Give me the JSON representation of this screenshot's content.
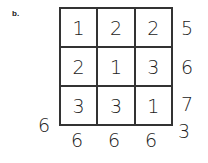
{
  "label": "b.",
  "grid": [
    [
      "1",
      "2",
      "2"
    ],
    [
      "2",
      "1",
      "3"
    ],
    [
      "3",
      "3",
      "1"
    ]
  ],
  "row_sums": [
    "5",
    "6",
    "7"
  ],
  "col_sums": [
    "6",
    "6",
    "6"
  ],
  "diag_sum_left": "6",
  "diag_sum_right": "3"
}
